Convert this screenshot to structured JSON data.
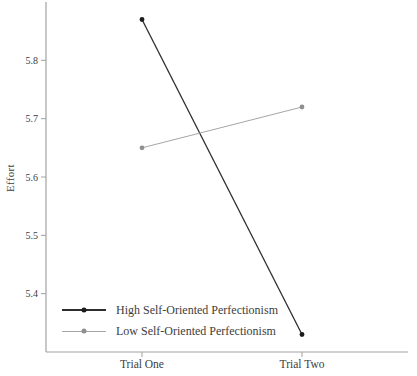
{
  "chart_data": {
    "type": "line",
    "title": "",
    "categories": [
      "Trial One",
      "Trial Two"
    ],
    "series": [
      {
        "name": "High Self-Oriented Perfectionism",
        "color": "#2e2e2e",
        "marker_color": "#1c1c1c",
        "values": [
          5.87,
          5.33
        ]
      },
      {
        "name": "Low Self-Oriented Perfectionism",
        "color": "#a6a6a6",
        "marker_color": "#8f8f8f",
        "values": [
          5.65,
          5.72
        ]
      }
    ],
    "xlabel": "",
    "ylabel": "Effort",
    "ylim": [
      5.3,
      5.9
    ],
    "yticks": [
      5.4,
      5.5,
      5.6,
      5.7,
      5.8
    ],
    "ytick_format_decimals": 1,
    "grid": false,
    "legend_position": "lower-left-inside",
    "axis_color": "#a2a2a2",
    "text_color": "#3d3d3d"
  }
}
